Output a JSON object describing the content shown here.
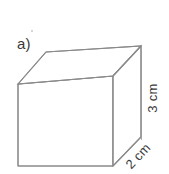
{
  "figure": {
    "part_label": "a)",
    "shape": "cube",
    "canvas": {
      "width": 169,
      "height": 174
    },
    "colors": {
      "background": "#ffffff",
      "stroke": "#8a8a8a",
      "stroke_light": "#a8a8a8",
      "text": "#3a3a3a"
    },
    "stroke_width": 1.1,
    "labels": {
      "height": "3 cm",
      "depth": "2 cm"
    },
    "geometry": {
      "front_face": [
        [
          18,
          84
        ],
        [
          113,
          76
        ],
        [
          113,
          166
        ],
        [
          18,
          166
        ]
      ],
      "back_top_left": [
        46,
        52
      ],
      "back_top_right": [
        141,
        46
      ],
      "back_bottom_right": [
        141,
        137
      ],
      "top_face": [
        [
          18,
          84
        ],
        [
          46,
          52
        ],
        [
          141,
          46
        ],
        [
          113,
          76
        ]
      ],
      "right_face": [
        [
          113,
          76
        ],
        [
          141,
          46
        ],
        [
          141,
          137
        ],
        [
          113,
          166
        ]
      ]
    },
    "dimension_guides": {
      "height_line": {
        "x": 150,
        "y1": 54,
        "y2": 146
      },
      "depth_line": {
        "x1": 118,
        "y1": 171,
        "x2": 146,
        "y2": 142
      }
    }
  }
}
